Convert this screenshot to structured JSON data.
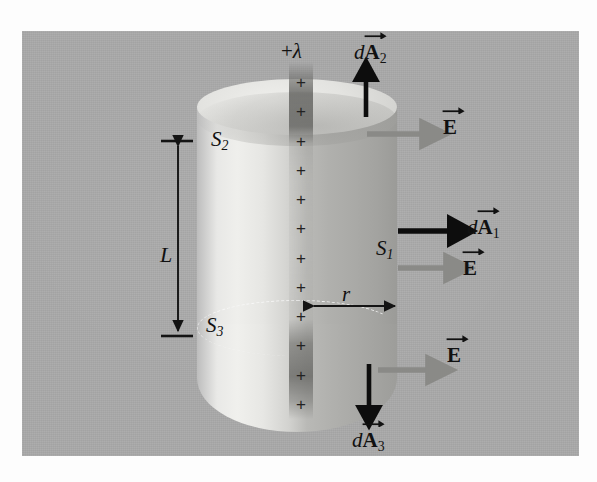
{
  "figure": {
    "background_color": "#a9a9a9",
    "page_color": "#fdfdfd"
  },
  "labels": {
    "linear_charge_density": "+",
    "lambda_symbol": "λ",
    "dA_prefix": "d",
    "A_symbol": "A",
    "E_symbol": "E",
    "S_symbol": "S",
    "sub_1": "1",
    "sub_2": "2",
    "sub_3": "3",
    "length_L": "L",
    "radius_r": "r"
  },
  "surfaces": [
    {
      "name": "S1",
      "label": "S",
      "subscript": "1",
      "description": "curved lateral surface of cylinder"
    },
    {
      "name": "S2",
      "label": "S",
      "subscript": "2",
      "description": "top end cap of cylinder"
    },
    {
      "name": "S3",
      "label": "S",
      "subscript": "3",
      "description": "bottom end cap of cylinder"
    }
  ],
  "vectors": [
    {
      "name": "dA2",
      "prefix": "d",
      "symbol": "A",
      "subscript": "2",
      "direction": "up",
      "color": "#0d0d0d",
      "surface": "S2"
    },
    {
      "name": "dA1",
      "prefix": "d",
      "symbol": "A",
      "subscript": "1",
      "direction": "right",
      "color": "#0d0d0d",
      "surface": "S1"
    },
    {
      "name": "dA3",
      "prefix": "d",
      "symbol": "A",
      "subscript": "3",
      "direction": "down",
      "color": "#0d0d0d",
      "surface": "S3"
    },
    {
      "name": "E-top",
      "symbol": "E",
      "direction": "right",
      "color": "#8a8a87",
      "surface": "S2"
    },
    {
      "name": "E-middle",
      "symbol": "E",
      "direction": "right",
      "color": "#8a8a87",
      "surface": "S1"
    },
    {
      "name": "E-bottom",
      "symbol": "E",
      "direction": "right",
      "color": "#8a8a87",
      "surface": "S3"
    }
  ],
  "dimensions": [
    {
      "name": "length",
      "label": "L",
      "orientation": "vertical",
      "arrow": "double-headed",
      "endcaps": "tick-marks"
    },
    {
      "name": "radius",
      "label": "r",
      "orientation": "horizontal",
      "arrow": "double-headed",
      "endcaps": "none"
    }
  ],
  "charged_line": {
    "symbol": "+",
    "density_label": "+λ",
    "plus_count": 12,
    "orientation": "vertical",
    "color": "#222222"
  },
  "colors": {
    "panel": "#a9a9a9",
    "cylinder_light": "#efefec",
    "cylinder_dark": "#9b9b98",
    "vector_black": "#0d0d0d",
    "vector_gray": "#8a8a87",
    "dashed_edge": "#fafafa",
    "text": "#111111"
  }
}
